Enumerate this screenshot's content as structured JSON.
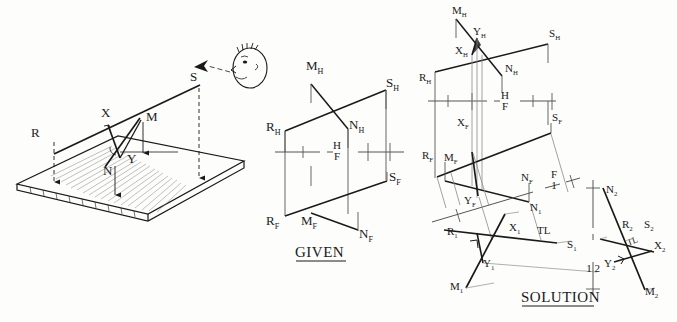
{
  "figure": {
    "kind": "descriptive-geometry-plate",
    "panels": [
      "pictorial",
      "given",
      "solution"
    ]
  },
  "pictorial": {
    "labels": {
      "R": "R",
      "X": "X",
      "S": "S",
      "M": "M",
      "Y": "Y",
      "N": "N"
    },
    "observer_icon": "observer-head-icon",
    "sight_arrow_icon": "sight-direction-arrow-icon"
  },
  "given": {
    "title": "GIVEN",
    "fold_line": {
      "top": "H",
      "bottom": "F"
    },
    "horizontal_view_labels": {
      "M_H": {
        "letter": "M",
        "sub": "H"
      },
      "S_H": {
        "letter": "S",
        "sub": "H"
      },
      "R_H": {
        "letter": "R",
        "sub": "H"
      },
      "N_H": {
        "letter": "N",
        "sub": "H"
      }
    },
    "frontal_view_labels": {
      "S_F": {
        "letter": "S",
        "sub": "F"
      },
      "R_F": {
        "letter": "R",
        "sub": "F"
      },
      "M_F": {
        "letter": "M",
        "sub": "F"
      },
      "N_F": {
        "letter": "N",
        "sub": "F"
      }
    }
  },
  "solution": {
    "title": "SOLUTION",
    "fold_lines": [
      {
        "name": "H-F",
        "top": "H",
        "bottom": "F"
      },
      {
        "name": "F-1",
        "top": "F",
        "bottom": "1"
      },
      {
        "name": "1-2",
        "left": "1",
        "right": "2"
      }
    ],
    "horizontal_view_labels": {
      "M_H": {
        "letter": "M",
        "sub": "H"
      },
      "Y_H": {
        "letter": "Y",
        "sub": "H"
      },
      "S_H": {
        "letter": "S",
        "sub": "H"
      },
      "X_H": {
        "letter": "X",
        "sub": "H"
      },
      "N_H": {
        "letter": "N",
        "sub": "H"
      },
      "R_H": {
        "letter": "R",
        "sub": "H"
      }
    },
    "frontal_view_labels": {
      "X_F": {
        "letter": "X",
        "sub": "F"
      },
      "S_F": {
        "letter": "S",
        "sub": "F"
      },
      "R_F": {
        "letter": "R",
        "sub": "F"
      },
      "M_F": {
        "letter": "M",
        "sub": "F"
      },
      "Y_F": {
        "letter": "Y",
        "sub": "F"
      },
      "N_F": {
        "letter": "N",
        "sub": "F"
      }
    },
    "aux1_view_labels": {
      "N_1": {
        "letter": "N",
        "sub": "1"
      },
      "X_1": {
        "letter": "X",
        "sub": "1"
      },
      "R_1": {
        "letter": "R",
        "sub": "1"
      },
      "TL": "TL",
      "S_1": {
        "letter": "S",
        "sub": "1"
      },
      "Y_1": {
        "letter": "Y",
        "sub": "1"
      },
      "M_1": {
        "letter": "M",
        "sub": "1"
      }
    },
    "aux2_view_labels": {
      "N_2": {
        "letter": "N",
        "sub": "2"
      },
      "R_2": {
        "letter": "R",
        "sub": "2"
      },
      "S_2": {
        "letter": "S",
        "sub": "2"
      },
      "TL": "TL",
      "X_2": {
        "letter": "X",
        "sub": "2"
      },
      "Y_2": {
        "letter": "Y",
        "sub": "2"
      },
      "M_2": {
        "letter": "M",
        "sub": "2"
      }
    },
    "annotations": {
      "true_length_1": "TL",
      "true_length_2": "TL"
    }
  },
  "colors": {
    "ink": "#1a1a1a",
    "thin": "#555555",
    "light": "#9a9a9a",
    "paper": "#fdfdfc"
  }
}
